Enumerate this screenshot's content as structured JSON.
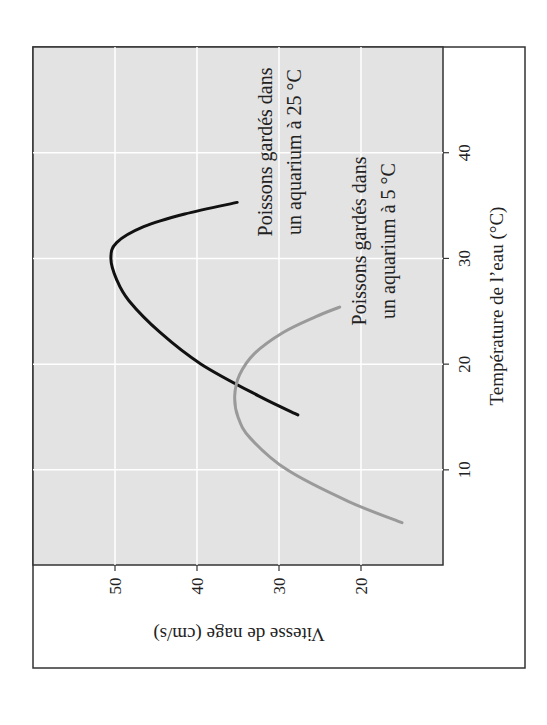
{
  "chart_data": {
    "type": "line",
    "orientation": "rotated 90° counter-clockwise (x axis runs vertically on the right, y axis runs horizontally at the bottom)",
    "title": "",
    "xlabel": "Température de l’eau (°C)",
    "ylabel": "Vitesse de nage (cm/s)",
    "xlim": [
      1,
      50
    ],
    "ylim": [
      10,
      60
    ],
    "xticks": [
      10,
      20,
      30,
      40
    ],
    "yticks": [
      20,
      30,
      40,
      50
    ],
    "grid": true,
    "series": [
      {
        "name": "Poissons gardés dans un aquarium à 25 °C",
        "color": "#111111",
        "x": [
          15.2,
          17,
          20,
          23,
          26,
          28,
          30,
          31.5,
          33,
          34.2,
          35.3
        ],
        "y": [
          27.7,
          32.5,
          39.5,
          44.5,
          48.3,
          49.8,
          50.5,
          49.8,
          46.5,
          41.5,
          35.1
        ]
      },
      {
        "name": "Poissons gardés dans un aquarium à 5 °C",
        "color": "#9a9a9a",
        "x": [
          5,
          7,
          10,
          13,
          15,
          17,
          19,
          21,
          23,
          24.5,
          25.4
        ],
        "y": [
          15,
          21.5,
          29,
          33.5,
          35,
          35.4,
          34.8,
          33,
          29.5,
          25.5,
          22.6
        ]
      }
    ],
    "annotations": [
      {
        "lines": [
          "Poissons gardés dans",
          "un aquarium à 25 °C"
        ],
        "series": 0
      },
      {
        "lines": [
          "Poissons gardés dans",
          "un aquarium à 5 °C"
        ],
        "series": 1
      }
    ]
  }
}
